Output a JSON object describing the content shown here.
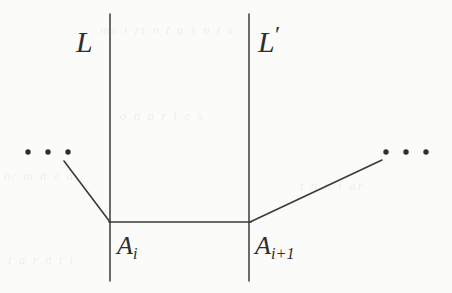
{
  "figure": {
    "type": "line-diagram",
    "caption_labels": {
      "left_line": "L",
      "right_line_base": "L",
      "right_line_prime": "′",
      "left_vertex_base": "A",
      "left_vertex_sub": "i",
      "right_vertex_base": "A",
      "right_vertex_sub": "i+1"
    },
    "ellipsis": {
      "left": "• • •",
      "right": "• • •"
    },
    "colors": {
      "background": "#fbfbfa",
      "ink": "#3a3a3a",
      "label_ink": "#2e2e2e"
    },
    "geometry": {
      "vertical_lines": [
        {
          "name": "L",
          "x": 110,
          "y1": 14,
          "y2": 281
        },
        {
          "name": "L-prime",
          "x": 249,
          "y1": 14,
          "y2": 281
        }
      ],
      "baseline": {
        "x1": 110,
        "y1": 222,
        "x2": 250,
        "y2": 222
      },
      "diagonals": [
        {
          "name": "left-diagonal",
          "x1": 64,
          "y1": 161,
          "x2": 110,
          "y2": 222
        },
        {
          "name": "right-diagonal",
          "x1": 250,
          "y1": 222,
          "x2": 382,
          "y2": 160
        }
      ],
      "dots": {
        "left": [
          {
            "x": 28,
            "y": 152
          },
          {
            "x": 48,
            "y": 152
          },
          {
            "x": 68,
            "y": 152
          }
        ],
        "right": [
          {
            "x": 386,
            "y": 152
          },
          {
            "x": 406,
            "y": 152
          },
          {
            "x": 426,
            "y": 152
          }
        ],
        "radius": 2.6
      }
    },
    "showthrough": {
      "top": "ms i  rt n   t  a   s    n  t  s",
      "mid": "o    n   a    r   t     e  s",
      "left": "o/     m   n     e  a",
      "right": "t   n      n i  ar",
      "bottom": "t   a     r  n    t i"
    }
  }
}
